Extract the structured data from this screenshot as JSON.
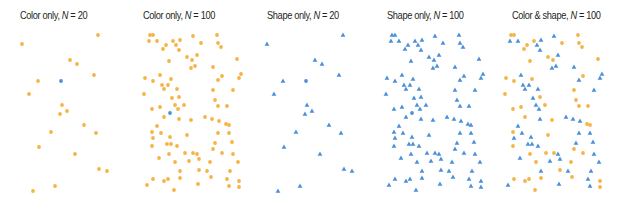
{
  "colors": {
    "orange": "#F6B346",
    "blue": "#4A90DA"
  },
  "panels": [
    {
      "title_prefix": "Color only, ",
      "n_label": "N",
      "n_suffix": " = 20",
      "title_x": 20
    },
    {
      "title_prefix": "Color only, ",
      "n_label": "N",
      "n_suffix": " = 100",
      "title_x": 143
    },
    {
      "title_prefix": "Shape only, ",
      "n_label": "N",
      "n_suffix": " = 20",
      "title_x": 267
    },
    {
      "title_prefix": "Shape only, ",
      "n_label": "N",
      "n_suffix": " = 100",
      "title_x": 387
    },
    {
      "title_prefix": "Color & shape, ",
      "n_label": "N",
      "n_suffix": " = 100",
      "title_x": 512
    }
  ],
  "chart_data": [
    {
      "type": "scatter",
      "title": "Color only, N = 20",
      "encoding": "color",
      "x_offset": 0,
      "points": [
        [
          98,
          35,
          "O"
        ],
        [
          22,
          44,
          "O"
        ],
        [
          70,
          60,
          "O"
        ],
        [
          77,
          64,
          "O"
        ],
        [
          94,
          75,
          "O"
        ],
        [
          38,
          81,
          "O"
        ],
        [
          61,
          81,
          "B"
        ],
        [
          29,
          94,
          "O"
        ],
        [
          62,
          105,
          "O"
        ],
        [
          67,
          111,
          "O"
        ],
        [
          60,
          114,
          "O"
        ],
        [
          84,
          125,
          "O"
        ],
        [
          51,
          132,
          "O"
        ],
        [
          96,
          133,
          "O"
        ],
        [
          39,
          147,
          "O"
        ],
        [
          75,
          154,
          "O"
        ],
        [
          99,
          169,
          "O"
        ],
        [
          107,
          171,
          "O"
        ],
        [
          55,
          186,
          "O"
        ],
        [
          33,
          191,
          "O"
        ]
      ]
    },
    {
      "type": "scatter",
      "title": "Color only, N = 100",
      "encoding": "color",
      "x_offset": 0,
      "points": [
        [
          150,
          35,
          "O"
        ],
        [
          153,
          35,
          "O"
        ],
        [
          149,
          41,
          "O"
        ],
        [
          157,
          41,
          "O"
        ],
        [
          193,
          36,
          "O"
        ],
        [
          217,
          35,
          "O"
        ],
        [
          173,
          41,
          "O"
        ],
        [
          180,
          40,
          "O"
        ],
        [
          166,
          45,
          "O"
        ],
        [
          163,
          49,
          "O"
        ],
        [
          176,
          45,
          "O"
        ],
        [
          179,
          50,
          "O"
        ],
        [
          218,
          43,
          "O"
        ],
        [
          221,
          47,
          "O"
        ],
        [
          201,
          43,
          "O"
        ],
        [
          169,
          61,
          "O"
        ],
        [
          187,
          57,
          "O"
        ],
        [
          192,
          60,
          "O"
        ],
        [
          197,
          55,
          "O"
        ],
        [
          191,
          68,
          "O"
        ],
        [
          195,
          66,
          "O"
        ],
        [
          213,
          67,
          "O"
        ],
        [
          237,
          59,
          "O"
        ],
        [
          145,
          78,
          "O"
        ],
        [
          153,
          81,
          "O"
        ],
        [
          160,
          75,
          "O"
        ],
        [
          171,
          79,
          "O"
        ],
        [
          162,
          85,
          "O"
        ],
        [
          168,
          85,
          "O"
        ],
        [
          164,
          89,
          "O"
        ],
        [
          177,
          89,
          "O"
        ],
        [
          222,
          76,
          "O"
        ],
        [
          218,
          80,
          "O"
        ],
        [
          241,
          74,
          "O"
        ],
        [
          239,
          78,
          "O"
        ],
        [
          144,
          94,
          "O"
        ],
        [
          213,
          90,
          "O"
        ],
        [
          233,
          90,
          "O"
        ],
        [
          172,
          98,
          "O"
        ],
        [
          179,
          97,
          "O"
        ],
        [
          215,
          100,
          "O"
        ],
        [
          175,
          105,
          "O"
        ],
        [
          184,
          105,
          "O"
        ],
        [
          152,
          109,
          "O"
        ],
        [
          160,
          107,
          "O"
        ],
        [
          178,
          109,
          "O"
        ],
        [
          218,
          106,
          "O"
        ],
        [
          227,
          106,
          "O"
        ],
        [
          170,
          113,
          "B"
        ],
        [
          164,
          117,
          "O"
        ],
        [
          179,
          119,
          "O"
        ],
        [
          191,
          120,
          "O"
        ],
        [
          205,
          117,
          "O"
        ],
        [
          212,
          119,
          "O"
        ],
        [
          219,
          121,
          "O"
        ],
        [
          226,
          124,
          "O"
        ],
        [
          229,
          125,
          "O"
        ],
        [
          157,
          126,
          "O"
        ],
        [
          152,
          132,
          "O"
        ],
        [
          161,
          133,
          "O"
        ],
        [
          153,
          138,
          "O"
        ],
        [
          170,
          137,
          "O"
        ],
        [
          187,
          135,
          "O"
        ],
        [
          218,
          133,
          "O"
        ],
        [
          229,
          133,
          "O"
        ],
        [
          152,
          146,
          "O"
        ],
        [
          167,
          144,
          "O"
        ],
        [
          171,
          144,
          "O"
        ],
        [
          177,
          146,
          "O"
        ],
        [
          215,
          143,
          "O"
        ],
        [
          232,
          142,
          "O"
        ],
        [
          213,
          149,
          "O"
        ],
        [
          169,
          154,
          "O"
        ],
        [
          185,
          153,
          "O"
        ],
        [
          193,
          153,
          "O"
        ],
        [
          197,
          154,
          "O"
        ],
        [
          222,
          153,
          "O"
        ],
        [
          233,
          154,
          "O"
        ],
        [
          159,
          158,
          "O"
        ],
        [
          175,
          162,
          "O"
        ],
        [
          189,
          161,
          "O"
        ],
        [
          199,
          159,
          "O"
        ],
        [
          210,
          162,
          "O"
        ],
        [
          238,
          162,
          "O"
        ],
        [
          180,
          171,
          "O"
        ],
        [
          199,
          170,
          "O"
        ],
        [
          207,
          171,
          "O"
        ],
        [
          230,
          171,
          "O"
        ],
        [
          153,
          179,
          "O"
        ],
        [
          164,
          181,
          "O"
        ],
        [
          168,
          179,
          "O"
        ],
        [
          180,
          178,
          "O"
        ],
        [
          211,
          177,
          "O"
        ],
        [
          227,
          179,
          "O"
        ],
        [
          239,
          181,
          "O"
        ],
        [
          147,
          185,
          "O"
        ],
        [
          198,
          184,
          "O"
        ],
        [
          229,
          186,
          "O"
        ],
        [
          239,
          187,
          "O"
        ],
        [
          174,
          190,
          "O"
        ]
      ]
    },
    {
      "type": "scatter",
      "title": "Shape only, N = 20",
      "encoding": "shape",
      "x_offset": 245,
      "source_panel": 0
    },
    {
      "type": "scatter",
      "title": "Shape only, N = 100",
      "encoding": "shape",
      "x_offset": 242,
      "source_panel": 1
    },
    {
      "type": "scatter",
      "title": "Color & shape, N = 100",
      "encoding": "color+shape",
      "x_offset": 361,
      "points": [
        [
          150,
          35,
          "O"
        ],
        [
          153,
          35,
          "O"
        ],
        [
          149,
          41,
          "B"
        ],
        [
          157,
          41,
          "B"
        ],
        [
          193,
          36,
          "B"
        ],
        [
          217,
          35,
          "O"
        ],
        [
          173,
          41,
          "O"
        ],
        [
          180,
          40,
          "B"
        ],
        [
          166,
          45,
          "O"
        ],
        [
          163,
          49,
          "O"
        ],
        [
          176,
          45,
          "B"
        ],
        [
          179,
          50,
          "B"
        ],
        [
          218,
          43,
          "O"
        ],
        [
          221,
          47,
          "O"
        ],
        [
          201,
          43,
          "O"
        ],
        [
          169,
          61,
          "O"
        ],
        [
          187,
          57,
          "O"
        ],
        [
          192,
          60,
          "O"
        ],
        [
          197,
          55,
          "B"
        ],
        [
          191,
          68,
          "B"
        ],
        [
          195,
          66,
          "B"
        ],
        [
          213,
          67,
          "B"
        ],
        [
          237,
          59,
          "O"
        ],
        [
          145,
          78,
          "O"
        ],
        [
          153,
          81,
          "O"
        ],
        [
          160,
          75,
          "B"
        ],
        [
          171,
          79,
          "O"
        ],
        [
          162,
          85,
          "B"
        ],
        [
          168,
          85,
          "B"
        ],
        [
          164,
          89,
          "B"
        ],
        [
          177,
          89,
          "B"
        ],
        [
          222,
          76,
          "O"
        ],
        [
          218,
          80,
          "B"
        ],
        [
          241,
          74,
          "B"
        ],
        [
          239,
          78,
          "B"
        ],
        [
          144,
          94,
          "O"
        ],
        [
          213,
          90,
          "O"
        ],
        [
          233,
          90,
          "B"
        ],
        [
          172,
          98,
          "B"
        ],
        [
          179,
          97,
          "O"
        ],
        [
          215,
          100,
          "O"
        ],
        [
          175,
          105,
          "B"
        ],
        [
          184,
          105,
          "O"
        ],
        [
          152,
          109,
          "O"
        ],
        [
          160,
          107,
          "O"
        ],
        [
          178,
          109,
          "B"
        ],
        [
          218,
          106,
          "O"
        ],
        [
          227,
          106,
          "O"
        ],
        [
          164,
          117,
          "O"
        ],
        [
          179,
          119,
          "B"
        ],
        [
          191,
          120,
          "O"
        ],
        [
          205,
          117,
          "B"
        ],
        [
          212,
          119,
          "B"
        ],
        [
          219,
          121,
          "B"
        ],
        [
          226,
          124,
          "O"
        ],
        [
          229,
          125,
          "O"
        ],
        [
          157,
          126,
          "B"
        ],
        [
          152,
          132,
          "O"
        ],
        [
          161,
          133,
          "B"
        ],
        [
          153,
          138,
          "B"
        ],
        [
          170,
          137,
          "B"
        ],
        [
          187,
          135,
          "O"
        ],
        [
          218,
          133,
          "B"
        ],
        [
          229,
          133,
          "B"
        ],
        [
          152,
          146,
          "O"
        ],
        [
          167,
          144,
          "B"
        ],
        [
          171,
          144,
          "B"
        ],
        [
          177,
          146,
          "B"
        ],
        [
          215,
          143,
          "B"
        ],
        [
          232,
          142,
          "B"
        ],
        [
          213,
          149,
          "O"
        ],
        [
          169,
          154,
          "O"
        ],
        [
          185,
          153,
          "O"
        ],
        [
          193,
          153,
          "O"
        ],
        [
          197,
          154,
          "B"
        ],
        [
          222,
          153,
          "O"
        ],
        [
          233,
          154,
          "B"
        ],
        [
          159,
          158,
          "B"
        ],
        [
          175,
          162,
          "O"
        ],
        [
          189,
          161,
          "B"
        ],
        [
          199,
          159,
          "B"
        ],
        [
          210,
          162,
          "O"
        ],
        [
          238,
          162,
          "B"
        ],
        [
          180,
          171,
          "B"
        ],
        [
          199,
          170,
          "O"
        ],
        [
          207,
          171,
          "B"
        ],
        [
          230,
          171,
          "B"
        ],
        [
          153,
          179,
          "O"
        ],
        [
          164,
          181,
          "O"
        ],
        [
          168,
          179,
          "O"
        ],
        [
          180,
          178,
          "O"
        ],
        [
          211,
          177,
          "O"
        ],
        [
          227,
          179,
          "B"
        ],
        [
          239,
          181,
          "O"
        ],
        [
          147,
          185,
          "B"
        ],
        [
          198,
          184,
          "B"
        ],
        [
          229,
          186,
          "B"
        ],
        [
          239,
          187,
          "O"
        ],
        [
          174,
          190,
          "O"
        ]
      ]
    }
  ]
}
